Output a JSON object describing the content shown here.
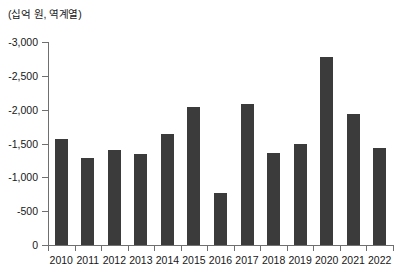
{
  "chart_data": {
    "type": "bar",
    "title": "",
    "subtitle": "",
    "xlabel": "",
    "ylabel": "(십억 원, 역계열)",
    "unit_caption": "(십억 원, 역계열)",
    "categories": [
      "2010",
      "2011",
      "2012",
      "2013",
      "2014",
      "2015",
      "2016",
      "2017",
      "2018",
      "2019",
      "2020",
      "2021",
      "2022"
    ],
    "values": [
      -1570,
      -1280,
      -1400,
      -1340,
      -1640,
      -2040,
      -770,
      -2080,
      -1360,
      -1500,
      -2780,
      -1940,
      -1440
    ],
    "series": [
      {
        "name": "",
        "values": [
          -1570,
          -1280,
          -1400,
          -1340,
          -1640,
          -2040,
          -770,
          -2080,
          -1360,
          -1500,
          -2780,
          -1940,
          -1440
        ]
      }
    ],
    "ylim": [
      0,
      -3000
    ],
    "y_axis_inverted": true,
    "y_ticks": [
      0,
      -500,
      -1000,
      -1500,
      -2000,
      -2500,
      -3000
    ],
    "y_tick_labels": [
      "0",
      "-500",
      "-1,000",
      "-1,500",
      "-2,000",
      "-2,500",
      "-3,000"
    ],
    "grid": false,
    "legend": false,
    "legend_position": "none",
    "bar_color": "#3b3b3b",
    "axis_color": "#6f6f6f",
    "background_color": "#ffffff"
  }
}
